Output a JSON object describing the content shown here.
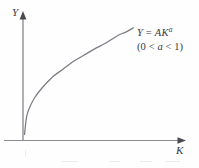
{
  "figure": {
    "background_color": "#fefefe",
    "ink_color": "#6f6f77",
    "text_color": "#39393e"
  },
  "axes": {
    "y_label": "Y",
    "x_label": "K"
  },
  "annotation": {
    "equation_prefix": "Y",
    "equation_equals": " = ",
    "equation_body": "AK",
    "equation_exponent": "a",
    "range": "(0 < a < 1)",
    "range_open": "(0 < ",
    "range_var": "a",
    "range_close": " < 1)"
  },
  "chart_data": {
    "type": "line",
    "title": "",
    "subtitle": "",
    "xlabel": "K",
    "ylabel": "Y",
    "annotations": [
      "Y = AK^a",
      "(0 < a < 1)"
    ],
    "grid": false,
    "legend": "none",
    "xlim": [
      0,
      1
    ],
    "ylim": [
      0,
      1
    ],
    "series": [
      {
        "name": "Y = AK^a",
        "description": "Concave increasing Cobb-Douglas production function with diminishing returns to capital",
        "exponent_a": 0.45,
        "coefficient_A": 1.0,
        "x": [
          0.0,
          0.02,
          0.05,
          0.09,
          0.14,
          0.2,
          0.27,
          0.35,
          0.44,
          0.54,
          0.64,
          0.75,
          0.86,
          0.93,
          1.0
        ],
        "y": [
          0.0,
          0.17,
          0.26,
          0.34,
          0.41,
          0.48,
          0.55,
          0.61,
          0.68,
          0.74,
          0.8,
          0.86,
          0.93,
          0.96,
          1.0
        ]
      }
    ]
  }
}
